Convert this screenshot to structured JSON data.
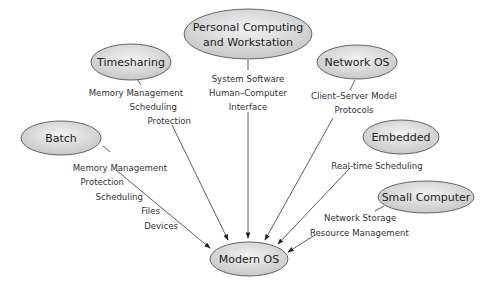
{
  "diagram": {
    "center": {
      "label": "Modern OS"
    },
    "nodes": [
      {
        "id": "timesharing",
        "label": "Timesharing",
        "features": [
          "Memory Management",
          "Scheduling",
          "Protection"
        ]
      },
      {
        "id": "personal",
        "label_lines": [
          "Personal Computing",
          "and Workstation"
        ],
        "features": [
          "System Software",
          "Human–Computer",
          "Interface"
        ]
      },
      {
        "id": "network",
        "label": "Network OS",
        "features": [
          "Client–Server Model",
          "Protocols"
        ]
      },
      {
        "id": "batch",
        "label": "Batch",
        "features": [
          "Memory Management",
          "Protection",
          "Scheduling",
          "Files",
          "Devices"
        ]
      },
      {
        "id": "embedded",
        "label": "Embedded",
        "features": [
          "Real-time Scheduling"
        ]
      },
      {
        "id": "small",
        "label": "Small Computer",
        "features": [
          "Network Storage",
          "Resource Management"
        ]
      }
    ]
  }
}
